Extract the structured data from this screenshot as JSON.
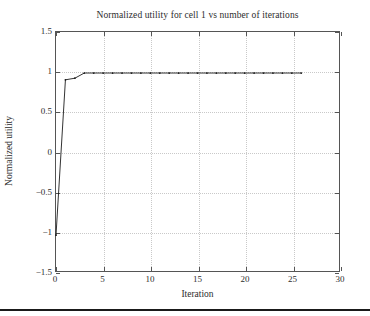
{
  "chart_data": {
    "type": "line",
    "title": "Normalized utility for cell 1 vs number of iterations",
    "xlabel": "Iteration",
    "ylabel": "Normalized utility",
    "xlim": [
      0,
      30
    ],
    "ylim": [
      -1.5,
      1.5
    ],
    "xticks": [
      0,
      5,
      10,
      15,
      20,
      25,
      30
    ],
    "xtick_labels": [
      "0",
      "5",
      "10",
      "15",
      "20",
      "25",
      "30"
    ],
    "yticks": [
      -1.5,
      -1,
      -0.5,
      0,
      0.5,
      1,
      1.5
    ],
    "ytick_labels": [
      "−1.5",
      "−1",
      "−0.5",
      "0",
      "0.5",
      "1",
      "1.5"
    ],
    "grid": true,
    "grid_style": "dotted",
    "grid_color": "#c9c9c9",
    "legend": null,
    "series": [
      {
        "name": "Normalized utility",
        "color": "#1a1a1a",
        "marker": "dot",
        "x": [
          0,
          1,
          2,
          3,
          4,
          5,
          6,
          7,
          8,
          9,
          10,
          11,
          12,
          13,
          14,
          15,
          16,
          17,
          18,
          19,
          20,
          21,
          22,
          23,
          24,
          25,
          26
        ],
        "values": [
          -1.05,
          0.9,
          0.92,
          0.985,
          0.985,
          0.985,
          0.985,
          0.985,
          0.985,
          0.985,
          0.985,
          0.985,
          0.985,
          0.985,
          0.985,
          0.985,
          0.985,
          0.985,
          0.985,
          0.985,
          0.985,
          0.985,
          0.985,
          0.985,
          0.985,
          0.985,
          0.985
        ]
      }
    ]
  },
  "figure": {
    "background_color": "#ffffff",
    "axes_color": "#555555",
    "text_color": "#2d2d2d"
  }
}
